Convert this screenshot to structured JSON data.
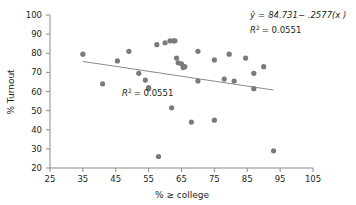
{
  "chart_data": {
    "type": "scatter",
    "title": "",
    "xlabel": "% ≥ college",
    "ylabel": "% Turnout",
    "xlim": [
      25,
      105
    ],
    "ylim": [
      20,
      100
    ],
    "xticks": [
      25,
      35,
      45,
      55,
      65,
      75,
      85,
      95,
      105
    ],
    "yticks": [
      20,
      30,
      40,
      50,
      60,
      70,
      80,
      90,
      100
    ],
    "grid": false,
    "legend": "none",
    "x": [
      35,
      41,
      45.5,
      49,
      52,
      54,
      55,
      55,
      57.5,
      58,
      60,
      61.5,
      62,
      62.5,
      63,
      63.5,
      64,
      65,
      65.5,
      66,
      68,
      70,
      70,
      75,
      75,
      78,
      79.5,
      81,
      84.5,
      87,
      87,
      90,
      93
    ],
    "y": [
      79.5,
      64,
      76,
      81,
      69.5,
      66,
      62,
      61.5,
      84.5,
      26,
      85.5,
      86.5,
      51.5,
      86.5,
      86.5,
      77.5,
      75,
      74.5,
      72.5,
      73,
      44,
      81,
      65.5,
      76.5,
      45,
      66.5,
      79.5,
      65.5,
      77.5,
      69.5,
      61.5,
      73,
      29
    ],
    "fit_line": {
      "x": [
        35,
        93
      ],
      "y": [
        75.71,
        60.76
      ]
    },
    "annotations": [
      {
        "id": "equation",
        "text": "ŷ = 84.731− .2577(x )",
        "x_px": 250,
        "y_px": 16
      },
      {
        "id": "r-squared-top",
        "text": "R2 = 0.0551",
        "x_px": 250,
        "y_px": 32
      },
      {
        "id": "r-squared-inner",
        "text": "R2 = 0.0551",
        "x_px": 152,
        "y_px": 95
      }
    ],
    "equation_parts": {
      "yhat": "ŷ",
      "equals": "=",
      "rhs": "84.731− .2577(x )",
      "r": "R",
      "exp": "2",
      "r_value": "= 0.0551"
    },
    "colors": {
      "point": "#7a7a7a",
      "line": "#8a8a8a",
      "axis": "#8b8b8b",
      "text": "#231f20",
      "background": "#ffffff"
    }
  }
}
